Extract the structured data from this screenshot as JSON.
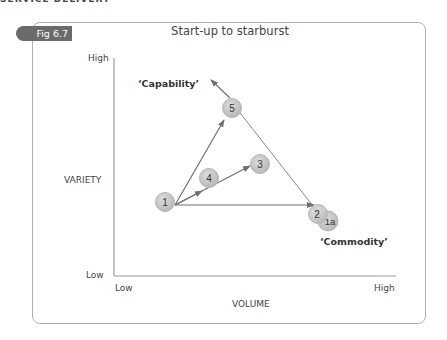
{
  "page": {
    "header_text": "SERVICE DELIVERY"
  },
  "figure": {
    "label": "Fig 6.7",
    "title": "Start-up to starburst"
  },
  "axes": {
    "y_label": "VARIETY",
    "y_high": "High",
    "y_low": "Low",
    "x_label": "VOLUME",
    "x_low": "Low",
    "x_high": "High"
  },
  "annotations": {
    "capability": "‘Capability’",
    "commodity": "‘Commodity’"
  },
  "nodes": [
    {
      "id": "1",
      "label": "1"
    },
    {
      "id": "2",
      "label": "2"
    },
    {
      "id": "1a",
      "label": "1a"
    },
    {
      "id": "3",
      "label": "3"
    },
    {
      "id": "4",
      "label": "4"
    },
    {
      "id": "5",
      "label": "5"
    }
  ],
  "colors": {
    "node_fill": "#c8c8c8",
    "node_stroke": "#b5b5b5",
    "line": "#707070",
    "tab": "#6b6b6b",
    "frame": "#b0b0b0"
  }
}
